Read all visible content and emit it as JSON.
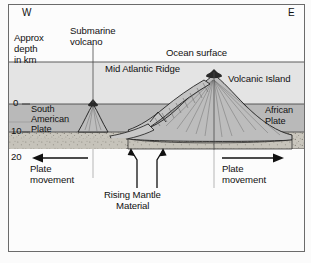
{
  "figure": {
    "type": "geology-cross-section",
    "title_visible": false,
    "compass": {
      "west": "W",
      "east": "E"
    },
    "axis": {
      "caption_line1": "Approx",
      "caption_line2": "depth",
      "caption_line3": "in km",
      "ticks": [
        "0",
        "10",
        "20"
      ],
      "unit": "km"
    },
    "labels": {
      "submarine_volcano_l1": "Submarine",
      "submarine_volcano_l2": "volcano",
      "ocean_surface": "Ocean surface",
      "mid_atlantic_ridge": "Mid Atlantic Ridge",
      "volcanic_island": "Volcanic Island",
      "south_american_plate_l1": "South",
      "south_american_plate_l2": "American",
      "south_american_plate_l3": "Plate",
      "african_plate_l1": "African",
      "african_plate_l2": "Plate",
      "plate_movement_left_l1": "Plate",
      "plate_movement_left_l2": "movement",
      "plate_movement_right_l1": "Plate",
      "plate_movement_right_l2": "movement",
      "rising_mantle_l1": "Rising Mantle",
      "rising_mantle_l2": "Material"
    },
    "colors": {
      "frame_border": "#6b6b6b",
      "page_background": "#fbfbfb",
      "ocean_water": "#e4e4e4",
      "crust_upper": "#b9b9b9",
      "crust_lower": "#c9c6bd",
      "mantle_blank": "#fcfcfc",
      "volcano_vent": "#2a2a2a",
      "edifice_fill": "#bdbdbd",
      "line_stroke": "#1a1a1a",
      "text": "#111111"
    },
    "geometry_notes": {
      "ocean_surface_y_km": "0 is seafloor datum; ocean surface drawn above",
      "depth_scale": [
        0,
        10,
        20
      ],
      "ridge_center_x_fraction": 0.62,
      "submarine_volcano_x_fraction": 0.3,
      "volcanic_island_x_fraction": 0.68
    }
  }
}
